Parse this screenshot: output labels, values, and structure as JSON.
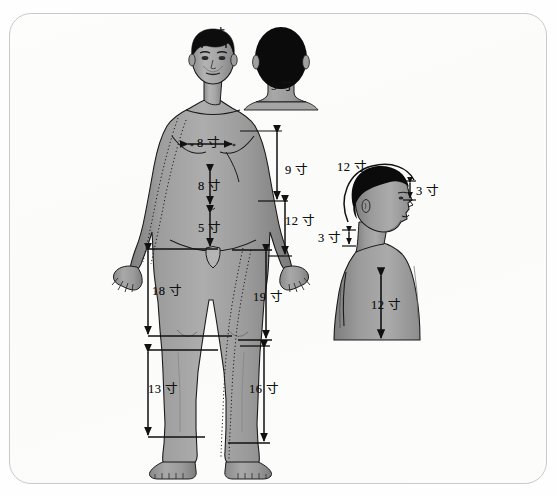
{
  "figure": {
    "unit": "寸",
    "frame_color": "#c9c9c9",
    "background_color": "#fefefe",
    "skin_color": "#9a9a9a",
    "hair_color": "#0d0d0d",
    "line_color": "#111111"
  },
  "views": {
    "front": {
      "name": "front-view-body"
    },
    "back_head": {
      "name": "back-head-view"
    },
    "side": {
      "name": "side-profile-view"
    }
  },
  "measurements": [
    {
      "id": "head-front-9",
      "value": "9",
      "unit": "寸",
      "label": "9 寸",
      "view": "front",
      "region": "anterior hairline to posterior hairline",
      "x": 205,
      "y": 32
    },
    {
      "id": "neck-back-9",
      "value": "9",
      "unit": "寸",
      "label": "9 寸",
      "view": "back_head",
      "region": "posterior neck width",
      "x": 281,
      "y": 86
    },
    {
      "id": "chest-width-8",
      "value": "8",
      "unit": "寸",
      "label": "8 寸",
      "view": "front",
      "region": "between nipples",
      "x": 207,
      "y": 144
    },
    {
      "id": "epigastric-8",
      "value": "8",
      "unit": "寸",
      "label": "8 寸",
      "view": "front",
      "region": "sternocostal angle to umbilicus",
      "x": 205,
      "y": 186
    },
    {
      "id": "lower-abdomen-5",
      "value": "5",
      "unit": "寸",
      "label": "5 寸",
      "view": "front",
      "region": "umbilicus to pubic symphysis",
      "x": 205,
      "y": 228
    },
    {
      "id": "axilla-elbow-9",
      "value": "9",
      "unit": "寸",
      "label": "9 寸",
      "view": "front",
      "region": "axillary fold to elbow crease",
      "x": 288,
      "y": 172
    },
    {
      "id": "elbow-wrist-12",
      "value": "12",
      "unit": "寸",
      "label": "12 寸",
      "view": "front",
      "region": "elbow crease to wrist crease",
      "x": 290,
      "y": 222
    },
    {
      "id": "thigh-left-18",
      "value": "18",
      "unit": "寸",
      "label": "18 寸",
      "view": "front",
      "region": "pubic symphysis to medial epicondyle",
      "x": 156,
      "y": 292
    },
    {
      "id": "thigh-right-19",
      "value": "19",
      "unit": "寸",
      "label": "19 寸",
      "view": "front",
      "region": "greater trochanter to knee",
      "x": 256,
      "y": 298
    },
    {
      "id": "leg-left-13",
      "value": "13",
      "unit": "寸",
      "label": "13 寸",
      "view": "front",
      "region": "medial condyle to medial malleolus",
      "x": 152,
      "y": 390
    },
    {
      "id": "leg-right-16",
      "value": "16",
      "unit": "寸",
      "label": "16 寸",
      "view": "front",
      "region": "knee to lateral malleolus",
      "x": 252,
      "y": 390
    },
    {
      "id": "head-arc-12",
      "value": "12",
      "unit": "寸",
      "label": "12 寸",
      "view": "side",
      "region": "head circumference arc",
      "x": 343,
      "y": 167
    },
    {
      "id": "forehead-3",
      "value": "3",
      "unit": "寸",
      "label": "3 寸",
      "view": "side",
      "region": "glabella to anterior hairline",
      "x": 404,
      "y": 191
    },
    {
      "id": "nape-3",
      "value": "3",
      "unit": "寸",
      "label": "3 寸",
      "view": "side",
      "region": "posterior hairline to C7",
      "x": 323,
      "y": 239
    },
    {
      "id": "back-12",
      "value": "12",
      "unit": "寸",
      "label": "12 寸",
      "view": "side",
      "region": "scapular / back length",
      "x": 377,
      "y": 306
    }
  ]
}
